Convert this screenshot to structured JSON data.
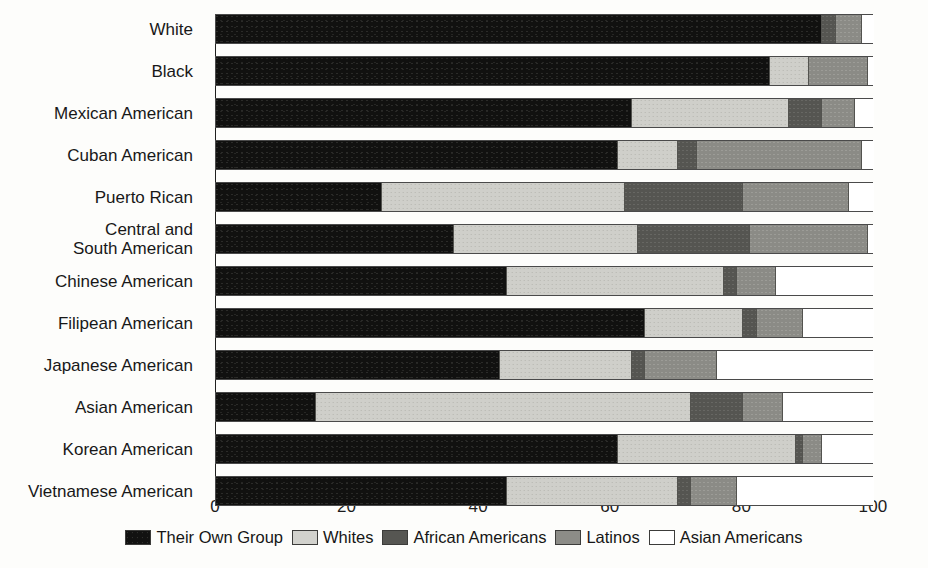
{
  "chart_data": {
    "type": "bar",
    "orientation": "horizontal",
    "stacked": true,
    "title": "",
    "xlabel": "",
    "ylabel": "",
    "xlim": [
      0,
      100
    ],
    "grid": false,
    "legend_position": "bottom",
    "xticks": [
      "0",
      "20",
      "40",
      "60",
      "80",
      "100"
    ],
    "xtick_values": [
      0,
      20,
      40,
      60,
      80,
      100
    ],
    "categories": [
      "White",
      "Black",
      "Mexican American",
      "Cuban American",
      "Puerto Rican",
      "Central and\nSouth American",
      "Chinese American",
      "Filipean American",
      "Japanese American",
      "Asian American",
      "Korean American",
      "Vietnamese American"
    ],
    "series": [
      {
        "name": "Their Own Group",
        "key": "own",
        "color": "#121211",
        "values": [
          92,
          84,
          63,
          61,
          25,
          36,
          44,
          65,
          43,
          15,
          61,
          44
        ]
      },
      {
        "name": "Whites",
        "key": "whites",
        "color": "#d2d2cd",
        "values": [
          0,
          6,
          24,
          9,
          37,
          28,
          33,
          15,
          20,
          57,
          27,
          26
        ]
      },
      {
        "name": "African Americans",
        "key": "african",
        "color": "#565652",
        "values": [
          2,
          0,
          5,
          3,
          18,
          17,
          2,
          2,
          2,
          8,
          1,
          2
        ]
      },
      {
        "name": "Latinos",
        "key": "latinos",
        "color": "#8c8c87",
        "values": [
          4,
          9,
          5,
          25,
          16,
          18,
          6,
          7,
          11,
          6,
          3,
          7
        ]
      },
      {
        "name": "Asian Americans",
        "key": "asian",
        "color": "#ffffff",
        "values": [
          2,
          1,
          3,
          2,
          4,
          1,
          15,
          11,
          24,
          14,
          8,
          21
        ]
      }
    ]
  },
  "legend": {
    "items": [
      {
        "label": "Their Own Group",
        "key": "own"
      },
      {
        "label": "Whites",
        "key": "whites"
      },
      {
        "label": "African Americans",
        "key": "african"
      },
      {
        "label": "Latinos",
        "key": "latinos"
      },
      {
        "label": "Asian Americans",
        "key": "asian"
      }
    ]
  }
}
